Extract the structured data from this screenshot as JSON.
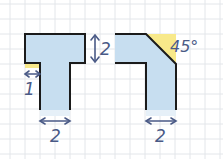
{
  "figure": {
    "width": 223,
    "height": 159,
    "background": "#ffffff",
    "grid": {
      "spacing": 15,
      "offset_x": 10,
      "offset_y": 4,
      "color": "#e3e6ea"
    },
    "colors": {
      "fill": "#c7def0",
      "outline": "#1b1b1b",
      "highlight": "#f8e98a",
      "annotation": "#4a5a86"
    }
  },
  "shapes": {
    "t_shape": {
      "name": "T-shaped piece",
      "dimension_labels": {
        "top_bar_height": "2",
        "overhang_width": "1",
        "stem_width": "2"
      }
    },
    "corner_shape": {
      "name": "L-shaped piece with 45 degree cut",
      "dimension_labels": {
        "angle": "45°",
        "leg_width": "2"
      }
    }
  }
}
